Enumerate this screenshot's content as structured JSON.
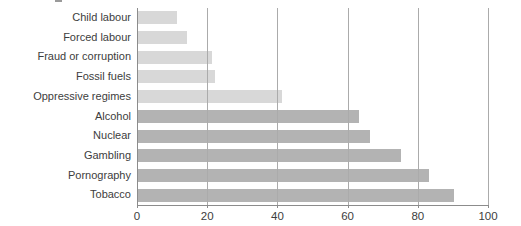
{
  "chart_data": {
    "type": "bar",
    "orientation": "horizontal",
    "title": "",
    "xlabel": "",
    "ylabel": "",
    "categories": [
      "Child labour",
      "Forced labour",
      "Fraud or corruption",
      "Fossil fuels",
      "Oppressive regimes",
      "Alcohol",
      "Nuclear",
      "Gambling",
      "Pornography",
      "Tobacco"
    ],
    "values": [
      11,
      14,
      21,
      22,
      41,
      63,
      66,
      75,
      83,
      90
    ],
    "bar_groups": [
      "light",
      "light",
      "light",
      "light",
      "light",
      "dark",
      "dark",
      "dark",
      "dark",
      "dark"
    ],
    "xlim": [
      0,
      100
    ],
    "x_ticks": [
      0,
      20,
      40,
      60,
      80,
      100
    ],
    "x_tick_labels": [
      "0",
      "20",
      "40",
      "60",
      "80",
      "100"
    ],
    "grid": true,
    "legend": false,
    "colors": {
      "light_bar": "#d8d8d8",
      "dark_bar": "#b3b3b3",
      "gridline": "#ababab",
      "axis": "#8c8c8c",
      "text": "#3d3d3d"
    }
  }
}
